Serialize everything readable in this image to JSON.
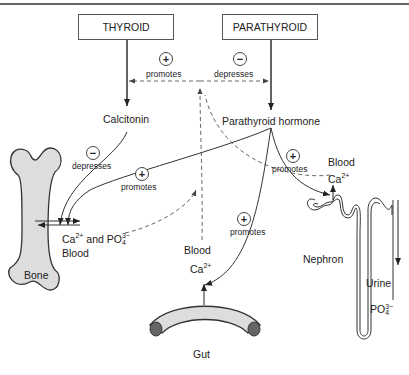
{
  "glands": {
    "thyroid": "THYROID",
    "parathyroid": "PARATHYROID"
  },
  "hormones": {
    "calcitonin": "Calcitonin",
    "pth": "Parathyroid hormone"
  },
  "effects": {
    "plus": "+",
    "minus": "−",
    "promotes": "promotes",
    "depresses": "depresses"
  },
  "organs": {
    "bone": "Bone",
    "gut": "Gut",
    "nephron": "Nephron"
  },
  "labels": {
    "blood": "Blood",
    "ca": "Ca",
    "ca_charge": "2+",
    "and": " and ",
    "po": "PO",
    "po_charge": "3−",
    "po_sub": "4",
    "urine": "Urine"
  }
}
